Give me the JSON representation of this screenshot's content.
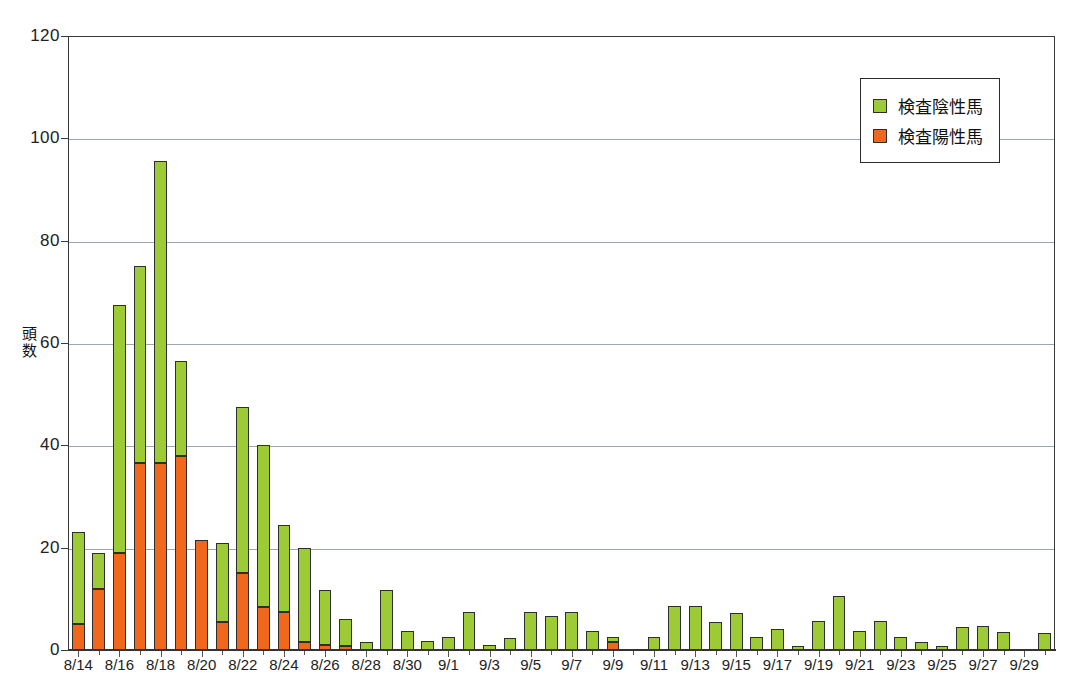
{
  "chart_data": {
    "type": "bar",
    "stacked": true,
    "title": "",
    "xlabel": "",
    "ylabel": "頭数",
    "ylim": [
      0,
      120
    ],
    "yticks": [
      0,
      20,
      40,
      60,
      80,
      100,
      120
    ],
    "grid": true,
    "legend_position": "top-right",
    "categories": [
      "8/14",
      "8/15",
      "8/16",
      "8/17",
      "8/18",
      "8/19",
      "8/20",
      "8/21",
      "8/22",
      "8/23",
      "8/24",
      "8/25",
      "8/26",
      "8/27",
      "8/28",
      "8/29",
      "8/30",
      "8/31",
      "9/1",
      "9/2",
      "9/3",
      "9/4",
      "9/5",
      "9/6",
      "9/7",
      "9/8",
      "9/9",
      "9/10",
      "9/11",
      "9/12",
      "9/13",
      "9/14",
      "9/15",
      "9/16",
      "9/17",
      "9/18",
      "9/19",
      "9/20",
      "9/21",
      "9/22",
      "9/23",
      "9/24",
      "9/25",
      "9/26",
      "9/27",
      "9/28",
      "9/29",
      "9/30"
    ],
    "tick_labels": [
      "8/14",
      "8/16",
      "8/18",
      "8/20",
      "8/22",
      "8/24",
      "8/26",
      "8/28",
      "8/30",
      "9/1",
      "9/3",
      "9/5",
      "9/7",
      "9/9",
      "9/11",
      "9/13",
      "9/15",
      "9/17",
      "9/19",
      "9/21",
      "9/23",
      "9/25",
      "9/27",
      "9/29"
    ],
    "series": [
      {
        "name": "検査陽性馬",
        "color": "#f1681c",
        "values": [
          5,
          12,
          19,
          36.5,
          36.5,
          38,
          21.5,
          5.5,
          15,
          8.5,
          7.5,
          1.5,
          1,
          0.8,
          0,
          0,
          0,
          0,
          0,
          0,
          0,
          0,
          0,
          0,
          0,
          0,
          1.5,
          0,
          0,
          0,
          0,
          0,
          0,
          0,
          0,
          0,
          0,
          0,
          0,
          0,
          0,
          0,
          0,
          0,
          0,
          0,
          0,
          0
        ]
      },
      {
        "name": "検査陰性馬",
        "color": "#9ccb35",
        "values": [
          18,
          7,
          48.5,
          38.5,
          59,
          18.5,
          -0.5,
          15.5,
          32.5,
          31.5,
          17,
          18.5,
          10.8,
          5.2,
          1.5,
          11.7,
          3.8,
          1.8,
          2.5,
          7.5,
          1,
          2.3,
          7.5,
          6.7,
          7.5,
          3.7,
          1,
          0,
          2.6,
          8.6,
          8.6,
          5.5,
          7.3,
          2.6,
          4.2,
          0.7,
          5.7,
          10.5,
          3.7,
          5.6,
          2.5,
          1.6,
          0.7,
          4.5,
          4.7,
          3.5,
          0,
          3.4
        ]
      }
    ],
    "totals": [
      23,
      19,
      67.5,
      75,
      95.5,
      56.5,
      21,
      21,
      47.5,
      40,
      24.5,
      20,
      11.8,
      6,
      1.5,
      11.7,
      3.8,
      1.8,
      2.5,
      7.5,
      1,
      2.3,
      7.5,
      6.7,
      7.5,
      3.7,
      2.5,
      0,
      2.6,
      8.6,
      8.6,
      5.5,
      7.3,
      2.6,
      4.2,
      0.7,
      5.7,
      10.5,
      3.7,
      5.6,
      2.5,
      1.6,
      0.7,
      4.5,
      4.7,
      3.5,
      3.2,
      3.4
    ]
  },
  "legend": {
    "items": [
      {
        "label": "検査陰性馬",
        "color": "#9ccb35"
      },
      {
        "label": "検査陽性馬",
        "color": "#f1681c"
      }
    ]
  },
  "axis": {
    "y_title": "頭数",
    "y_title_chars": [
      "頭",
      "数"
    ]
  }
}
